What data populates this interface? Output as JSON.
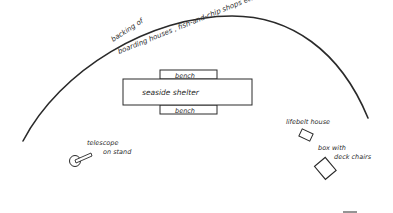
{
  "diagram": {
    "type": "site-plan sketch",
    "arc_label": {
      "line1": "backing of",
      "line2": "boarding houses , fish-and-chip shops etc."
    },
    "shelter": {
      "label": "seaside shelter",
      "bench_top": "bench",
      "bench_bottom": "bench"
    },
    "telescope": {
      "line1": "telescope",
      "line2": "on stand",
      "icon": "telescope-icon"
    },
    "lifebelt_house": {
      "label": "lifebelt house",
      "icon": "box-outline-icon"
    },
    "deck_chairs_box": {
      "line1": "box with",
      "line2": "deck chairs",
      "icon": "box-outline-icon"
    },
    "colors": {
      "stroke": "#2a2a2a",
      "background": "#ffffff"
    }
  }
}
